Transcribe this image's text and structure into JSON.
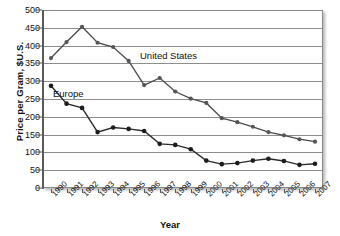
{
  "chart_data": {
    "type": "line",
    "title": "",
    "xlabel": "Year",
    "ylabel": "Price per Gram, $U.S.",
    "ylim": [
      0,
      500
    ],
    "ytick_step": 50,
    "yticks": [
      0,
      50,
      100,
      150,
      200,
      250,
      300,
      350,
      400,
      450,
      500
    ],
    "grid": "horizontal",
    "legend_position": "inline-annotations",
    "categories": [
      "1990",
      "1991",
      "1992",
      "1993",
      "1994",
      "1995",
      "1996",
      "1997",
      "1998",
      "1999",
      "2000",
      "2001",
      "2002",
      "2003",
      "2004",
      "2005",
      "2006",
      "2007"
    ],
    "series": [
      {
        "name": "United States",
        "color": "#4a4a4a",
        "values": [
          365,
          410,
          453,
          408,
          396,
          357,
          289,
          309,
          271,
          251,
          239,
          196,
          185,
          172,
          157,
          148,
          137,
          130
        ]
      },
      {
        "name": "Europe",
        "color": "#1c1c1c",
        "values": [
          287,
          237,
          225,
          157,
          170,
          166,
          160,
          124,
          121,
          109,
          77,
          67,
          70,
          77,
          82,
          76,
          65,
          68
        ]
      }
    ],
    "annotations": [
      {
        "text": "United States",
        "series": "United States"
      },
      {
        "text": "Europe",
        "series": "Europe"
      }
    ]
  }
}
